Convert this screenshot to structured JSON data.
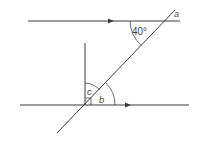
{
  "diagram": {
    "type": "parallel-lines-transversal",
    "labels": {
      "given_angle": "40°",
      "a": "a",
      "b": "b",
      "c": "c"
    },
    "colors": {
      "line": "#3a3a3a",
      "text": "#444444",
      "background": "#ffffff"
    },
    "elements": [
      {
        "name": "top-parallel-line",
        "arrow": "right"
      },
      {
        "name": "bottom-parallel-line",
        "arrow": "right"
      },
      {
        "name": "transversal-line"
      },
      {
        "name": "vertical-perpendicular-line",
        "right_angle_marker": true
      }
    ]
  }
}
